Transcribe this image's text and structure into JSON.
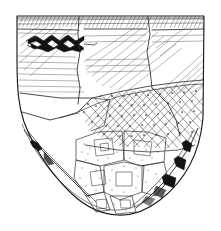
{
  "figure": {
    "technique": "pen-and-ink line drawing with hatching and stipple",
    "caption": "",
    "background_color": "#ffffff",
    "ink_color": "#1a1a1a",
    "canvas": {
      "width": 221,
      "height": 231
    }
  },
  "vessel": {
    "form": "deep conical / shield-shaped bowl with rounded pointed base",
    "outline": {
      "rim_y": 16,
      "base_y": 215,
      "left_x": 17,
      "right_x": 204,
      "max_width": 187
    },
    "zones": [
      {
        "id": "rim-band",
        "label": "Rim band",
        "ornament": "dense fine hatching",
        "y_top": 16,
        "y_bottom": 27,
        "color": "#575757"
      },
      {
        "id": "upper-body",
        "label": "Upper body",
        "ornament": "diagonal hatching and horizontal incised lines",
        "y_top": 27,
        "y_bottom": 88,
        "color": "#555555"
      },
      {
        "id": "zigzag-motif",
        "label": "Zigzag motif",
        "ornament": "solid dark filled zigzag / diamond band",
        "y_top": 34,
        "y_bottom": 52,
        "color": "#121212"
      },
      {
        "id": "lattice-zone",
        "label": "Lattice zone",
        "ornament": "diagonal crosshatch lattice with dotted intersections",
        "y_top": 84,
        "y_bottom": 138,
        "color": "#3a3a3a"
      },
      {
        "id": "lower-panels",
        "label": "Lower panel zone",
        "ornament": "irregular stippled panels",
        "y_top": 132,
        "y_bottom": 213,
        "color": "#333333"
      },
      {
        "id": "basal-edge",
        "label": "Basal edge",
        "ornament": "solid dark patches along the curved lower edge",
        "y_top": 135,
        "y_bottom": 212,
        "color": "#121212"
      }
    ],
    "sherd_breaks": [
      {
        "id": "break-1",
        "description": "vertical break, left of centre"
      },
      {
        "id": "break-2",
        "description": "vertical break, centre"
      },
      {
        "id": "break-3",
        "description": "vertical break, right of centre"
      },
      {
        "id": "break-4",
        "description": "horizontal break below rim band"
      },
      {
        "id": "break-5",
        "description": "irregular break across lower body"
      }
    ]
  }
}
